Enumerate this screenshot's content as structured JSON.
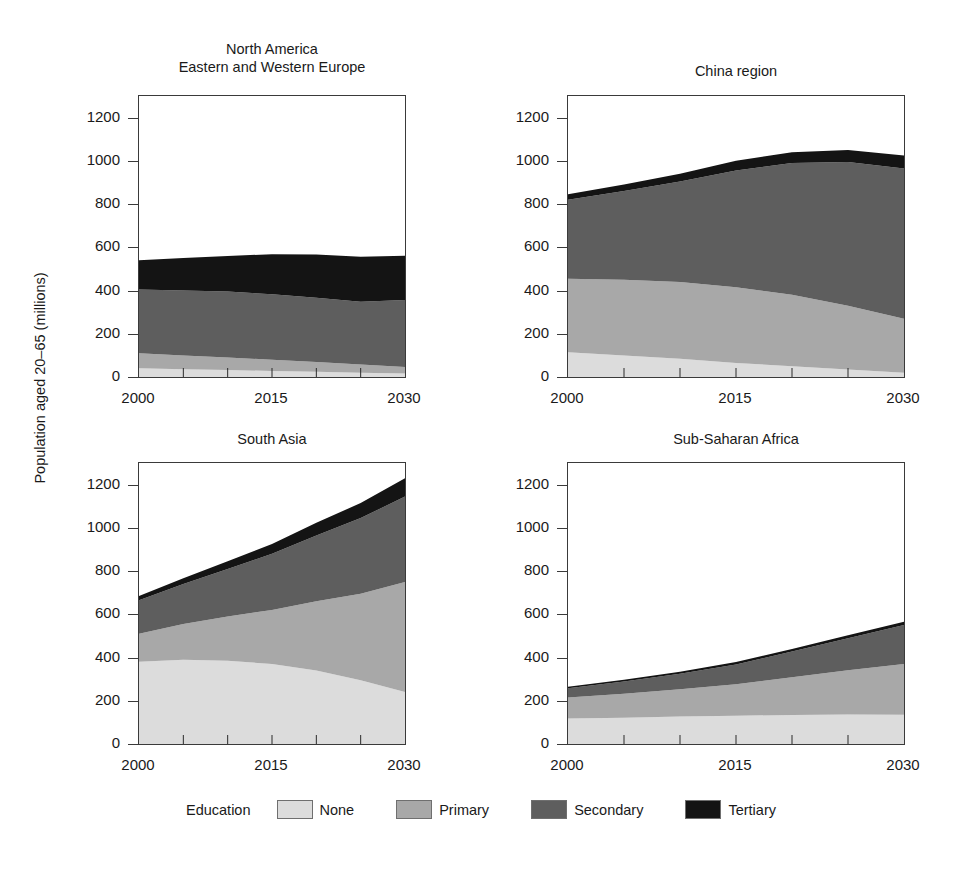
{
  "figure": {
    "ylabel": "Population aged 20–65 (millions)",
    "legend_title": "Education"
  },
  "colors": {
    "none": "#dcdcdc",
    "primary": "#a8a8a8",
    "secondary": "#5e5e5e",
    "tertiary": "#141414",
    "axis": "#3a3a3a",
    "text": "#1a1a1a"
  },
  "axes": {
    "y_ticks": [
      0,
      200,
      400,
      600,
      800,
      1000,
      1200
    ],
    "y_tick_labels": [
      "0",
      "200",
      "400",
      "600",
      "800",
      "1000",
      "1200"
    ],
    "ylim": [
      0,
      1300
    ],
    "x_ticks": [
      2000,
      2015,
      2030
    ],
    "x_tick_labels": [
      "2000",
      "2015",
      "2030"
    ],
    "x_minor_ticks": [
      2005,
      2010,
      2020,
      2025
    ],
    "xlim": [
      2000,
      2030
    ]
  },
  "panels": [
    {
      "id": "north-america-europe",
      "title_lines": [
        "North America",
        "Eastern and Western Europe"
      ]
    },
    {
      "id": "china-region",
      "title_lines": [
        "China region"
      ]
    },
    {
      "id": "south-asia",
      "title_lines": [
        "South Asia"
      ]
    },
    {
      "id": "sub-saharan-africa",
      "title_lines": [
        "Sub-Saharan Africa"
      ]
    }
  ],
  "legend": [
    {
      "key": "none",
      "label": "None"
    },
    {
      "key": "primary",
      "label": "Primary"
    },
    {
      "key": "secondary",
      "label": "Secondary"
    },
    {
      "key": "tertiary",
      "label": "Tertiary"
    }
  ],
  "chart_data": {
    "type": "area",
    "stacked": true,
    "title": "",
    "xlabel": "",
    "ylabel": "Population aged 20–65 (millions)",
    "xlim": [
      2000,
      2030
    ],
    "ylim": [
      0,
      1300
    ],
    "grid": false,
    "legend_position": "bottom",
    "legend_title": "Education",
    "series_names": [
      "None",
      "Primary",
      "Secondary",
      "Tertiary"
    ],
    "x": [
      2000,
      2005,
      2010,
      2015,
      2020,
      2025,
      2030
    ],
    "panels": [
      {
        "name": "North America / Eastern and Western Europe",
        "title_lines": [
          "North America",
          "Eastern and Western Europe"
        ],
        "series": [
          {
            "name": "None",
            "values": [
              40,
              36,
              32,
              28,
              24,
              20,
              16
            ]
          },
          {
            "name": "Primary",
            "values": [
              70,
              64,
              58,
              52,
              45,
              38,
              30
            ]
          },
          {
            "name": "Secondary",
            "values": [
              295,
              300,
              305,
              303,
              298,
              290,
              310
            ]
          },
          {
            "name": "Tertiary",
            "values": [
              135,
              150,
              165,
              185,
              200,
              208,
              205
            ]
          }
        ],
        "totals": [
          540,
          550,
          560,
          568,
          567,
          556,
          561
        ]
      },
      {
        "name": "China region",
        "title_lines": [
          "China region"
        ],
        "series": [
          {
            "name": "None",
            "values": [
              115,
              100,
              85,
              65,
              50,
              35,
              20
            ]
          },
          {
            "name": "Primary",
            "values": [
              340,
              350,
              355,
              350,
              330,
              295,
              250
            ]
          },
          {
            "name": "Secondary",
            "values": [
              365,
              410,
              465,
              540,
              610,
              665,
              695
            ]
          },
          {
            "name": "Tertiary",
            "values": [
              25,
              30,
              35,
              45,
              50,
              55,
              60
            ]
          }
        ],
        "totals": [
          845,
          890,
          940,
          1000,
          1040,
          1050,
          1025
        ]
      },
      {
        "name": "South Asia",
        "title_lines": [
          "South Asia"
        ],
        "series": [
          {
            "name": "None",
            "values": [
              380,
              390,
              385,
              370,
              340,
              295,
              240
            ]
          },
          {
            "name": "Primary",
            "values": [
              130,
              165,
              205,
              250,
              320,
              400,
              510
            ]
          },
          {
            "name": "Secondary",
            "values": [
              155,
              185,
              220,
              260,
              305,
              350,
              395
            ]
          },
          {
            "name": "Tertiary",
            "values": [
              20,
              27,
              35,
              45,
              58,
              70,
              85
            ]
          }
        ],
        "totals": [
          685,
          767,
          845,
          925,
          1023,
          1115,
          1230
        ]
      },
      {
        "name": "Sub-Saharan Africa",
        "title_lines": [
          "Sub-Saharan Africa"
        ],
        "series": [
          {
            "name": "None",
            "values": [
              118,
              122,
              127,
              131,
              134,
              136,
              135
            ]
          },
          {
            "name": "Primary",
            "values": [
              97,
              110,
              126,
              145,
              175,
              205,
              235
            ]
          },
          {
            "name": "Secondary",
            "values": [
              43,
              57,
              72,
              92,
              119,
              148,
              180
            ]
          },
          {
            "name": "Tertiary",
            "values": [
              7,
              8,
              9,
              11,
              12,
              14,
              15
            ]
          }
        ],
        "totals": [
          265,
          297,
          334,
          379,
          440,
          503,
          565
        ]
      }
    ]
  }
}
